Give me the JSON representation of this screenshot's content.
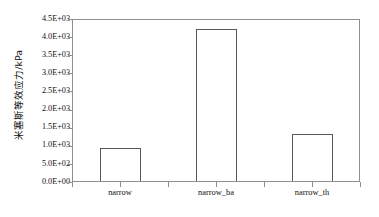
{
  "chart_data": {
    "type": "bar",
    "title": "",
    "subtitle": "",
    "xlabel": "",
    "ylabel": "米塞斯等效应力/kPa",
    "categories": [
      "narrow",
      "narrow_ba",
      "narrow_th"
    ],
    "values": [
      920,
      4200,
      1300
    ],
    "series": [
      {
        "name": "米塞斯等效应力",
        "values": [
          920,
          4200,
          1300
        ]
      }
    ],
    "ylim": [
      0,
      4500
    ],
    "yticks": [
      0,
      500,
      1000,
      1500,
      2000,
      2500,
      3000,
      3500,
      4000,
      4500
    ],
    "ytick_labels": [
      "0.0E+00",
      "5.0E+02",
      "1.0E+03",
      "1.5E+03",
      "2.0E+03",
      "2.5E+03",
      "3.0E+03",
      "3.5E+03",
      "4.0E+03",
      "4.5E+03"
    ],
    "grid": false,
    "legend": false,
    "legend_position": "none",
    "bar_fill_color": "#ffffff",
    "bar_edge_color": "#585858",
    "axis_color": "#8e8e8e",
    "background_color": "#ffffff",
    "text_color": "#0f0f0f"
  }
}
